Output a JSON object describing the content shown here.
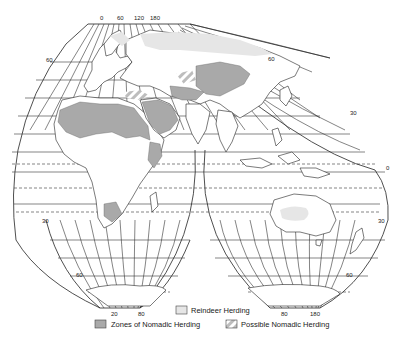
{
  "map": {
    "title": "Zones of Nomadic Herding",
    "projection": "interrupted",
    "top_longitude_labels": [
      "0",
      "60",
      "120",
      "180"
    ],
    "latitude_labels": {
      "left_north": "60",
      "right_north_upper": "60",
      "right_north_lower": "30",
      "left_south": "30",
      "right_south": "30",
      "left_south_lower": "60",
      "right_south_lower": "60"
    },
    "bottom_longitude_labels_left": [
      "20",
      "80"
    ],
    "bottom_longitude_labels_right": [
      "80",
      "180"
    ],
    "equator_label": "0"
  },
  "legend": {
    "items": [
      {
        "key": "reindeer",
        "label": "Reindeer Herding",
        "color": "#e6e6e6"
      },
      {
        "key": "nomadic",
        "label": "Zones of Nomadic Herding",
        "color": "#a9a9a9"
      },
      {
        "key": "possible",
        "label": "Possible Nomadic Herding",
        "pattern": "hatched"
      }
    ]
  },
  "colors": {
    "nomadic": "#a9a9a9",
    "reindeer": "#e6e6e6",
    "line": "#222222",
    "background": "#ffffff"
  }
}
